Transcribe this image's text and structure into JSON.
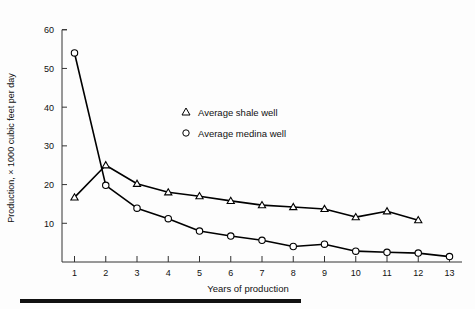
{
  "chart_data": {
    "type": "line",
    "title": "",
    "xlabel": "Years of production",
    "ylabel": "Production, × 1000 cubic feet per day",
    "x": [
      1,
      2,
      3,
      4,
      5,
      6,
      7,
      8,
      9,
      10,
      11,
      12,
      13
    ],
    "xticklabels": [
      "1",
      "2",
      "3",
      "4",
      "5",
      "6",
      "7",
      "8",
      "9",
      "10",
      "11",
      "12",
      "13"
    ],
    "yticks": [
      10,
      20,
      30,
      40,
      50,
      60
    ],
    "yticklabels": [
      "10",
      "20",
      "30",
      "40",
      "50",
      "60"
    ],
    "xlim": [
      0.6,
      13.4
    ],
    "ylim": [
      0,
      62
    ],
    "grid": false,
    "legend_position": "center",
    "series": [
      {
        "name": "Average shale well",
        "marker": "triangle",
        "x": [
          1,
          2,
          3,
          4,
          5,
          6,
          7,
          8,
          9,
          10,
          11,
          12
        ],
        "values": [
          16.7,
          25.0,
          20.2,
          18.0,
          17.0,
          15.8,
          14.7,
          14.2,
          13.7,
          11.6,
          13.1,
          10.8
        ]
      },
      {
        "name": "Average medina well",
        "marker": "circle",
        "x": [
          1,
          2,
          3,
          4,
          5,
          6,
          7,
          8,
          9,
          10,
          11,
          12,
          13
        ],
        "values": [
          54.0,
          19.8,
          13.9,
          11.2,
          8.0,
          6.7,
          5.6,
          4.0,
          4.6,
          2.8,
          2.5,
          2.3,
          1.4
        ]
      }
    ]
  },
  "legend": {
    "items": [
      {
        "label": "Average shale well",
        "marker": "triangle"
      },
      {
        "label": "Average medina well",
        "marker": "circle"
      }
    ]
  },
  "colors": {
    "line": "#000000",
    "marker_fill": "#ffffff",
    "axis": "#333333",
    "background": "#fdfdfd",
    "rule": "#111111"
  }
}
